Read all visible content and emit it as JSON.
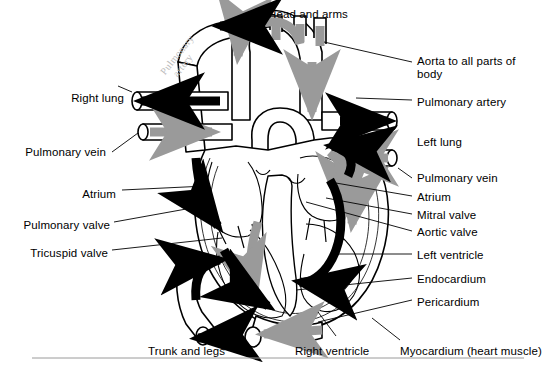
{
  "diagram": {
    "type": "labeled-anatomical-diagram",
    "colors": {
      "outline": "#000000",
      "background": "#ffffff",
      "oxygenated_flow": "#9a9a9a",
      "deoxygenated_flow": "#000000",
      "leader_line": "#000000",
      "handwriting": "#b9b9b9"
    },
    "flow_legend": {
      "gray_arrow": "oxygenated blood flow",
      "black_arrow": "deoxygenated blood flow"
    }
  },
  "labels": {
    "top": [
      {
        "id": "head-and-arms",
        "text": "Head and arms",
        "x": 268,
        "y": 8,
        "side": "right"
      }
    ],
    "left": [
      {
        "id": "right-lung",
        "text": "Right lung",
        "x": 70,
        "y": 92,
        "side": "left"
      },
      {
        "id": "pulmonary-vein-left",
        "text": "Pulmonary vein",
        "x": 24,
        "y": 146,
        "side": "left"
      },
      {
        "id": "atrium-left",
        "text": "Atrium",
        "x": 80,
        "y": 188,
        "side": "left"
      },
      {
        "id": "pulmonary-valve",
        "text": "Pulmonary valve",
        "x": 20,
        "y": 219,
        "side": "left"
      },
      {
        "id": "tricuspid-valve",
        "text": "Tricuspid valve",
        "x": 25,
        "y": 247,
        "side": "left"
      },
      {
        "id": "trunk-and-legs",
        "text": "Trunk and legs",
        "x": 152,
        "y": 345,
        "side": "left"
      }
    ],
    "right": [
      {
        "id": "aorta-to-all-parts-of-body",
        "text": "Aorta to all parts of body",
        "x": 417,
        "y": 55,
        "side": "right"
      },
      {
        "id": "pulmonary-artery",
        "text": "Pulmonary artery",
        "x": 417,
        "y": 96,
        "side": "right"
      },
      {
        "id": "left-lung",
        "text": "Left lung",
        "x": 417,
        "y": 136,
        "side": "right"
      },
      {
        "id": "pulmonary-vein-right",
        "text": "Pulmonary vein",
        "x": 417,
        "y": 172,
        "side": "right"
      },
      {
        "id": "atrium-right",
        "text": "Atrium",
        "x": 417,
        "y": 191,
        "side": "right"
      },
      {
        "id": "mitral-valve",
        "text": "Mitral valve",
        "x": 417,
        "y": 209,
        "side": "right"
      },
      {
        "id": "aortic-valve",
        "text": "Aortic valve",
        "x": 417,
        "y": 226,
        "side": "right"
      },
      {
        "id": "left-ventricle",
        "text": "Left ventricle",
        "x": 417,
        "y": 249,
        "side": "right"
      },
      {
        "id": "endocardium",
        "text": "Endocardium",
        "x": 417,
        "y": 273,
        "side": "right"
      },
      {
        "id": "pericardium",
        "text": "Pericardium",
        "x": 417,
        "y": 296,
        "side": "right"
      },
      {
        "id": "myocardium",
        "text": "Myocardium (heart muscle)",
        "x": 400,
        "y": 345,
        "side": "right"
      }
    ],
    "bottom": [
      {
        "id": "right-ventricle",
        "text": "Right ventricle",
        "x": 295,
        "y": 345,
        "side": "center"
      }
    ],
    "handwritten": [
      {
        "id": "handwritten-pulmonary-artery",
        "line1": "Pulmonary",
        "line2": "artery",
        "x": 158,
        "y": 70
      }
    ]
  }
}
